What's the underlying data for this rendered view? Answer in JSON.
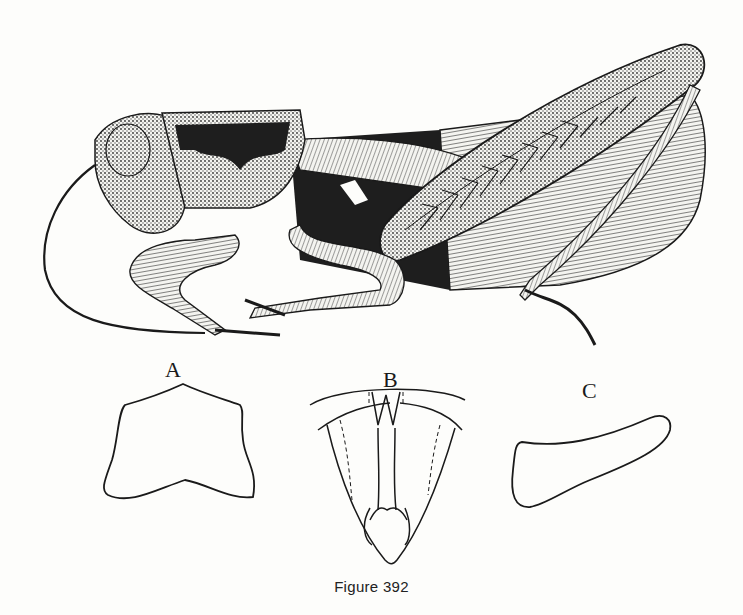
{
  "figure": {
    "caption": "Figure 392",
    "main_subject": "grasshopper-lateral-view",
    "panels": [
      {
        "label": "A",
        "subject": "pronotum-outline"
      },
      {
        "label": "B",
        "subject": "ventral-sternum-outline"
      },
      {
        "label": "C",
        "subject": "cercus-outline"
      }
    ],
    "colors": {
      "ink": "#1a1a1a",
      "paper": "#fdfdfb"
    }
  }
}
